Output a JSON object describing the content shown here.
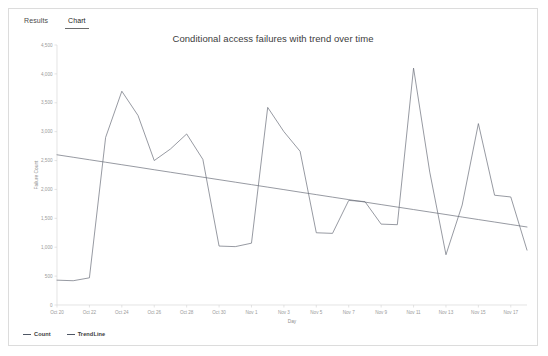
{
  "tabs": [
    {
      "label": "Results",
      "active": false
    },
    {
      "label": "Chart",
      "active": true
    }
  ],
  "chart_data": {
    "type": "line",
    "title": "Conditional access failures with trend over time",
    "xlabel": "Day",
    "ylabel": "Failure Count",
    "ylim": [
      0,
      4500
    ],
    "ytick_labels": [
      "0",
      "500",
      "1,000",
      "1,500",
      "2,000",
      "2,500",
      "3,000",
      "3,500",
      "4,000",
      "4,500"
    ],
    "ytick_values": [
      0,
      500,
      1000,
      1500,
      2000,
      2500,
      3000,
      3500,
      4000,
      4500
    ],
    "grid": false,
    "legend_position": "bottom-left",
    "categories": [
      "Oct 20",
      "Oct 21",
      "Oct 22",
      "Oct 23",
      "Oct 24",
      "Oct 25",
      "Oct 26",
      "Oct 27",
      "Oct 28",
      "Oct 29",
      "Oct 30",
      "Oct 31",
      "Nov 1",
      "Nov 2",
      "Nov 3",
      "Nov 4",
      "Nov 5",
      "Nov 6",
      "Nov 7",
      "Nov 8",
      "Nov 9",
      "Nov 10",
      "Nov 11",
      "Nov 12",
      "Nov 13",
      "Nov 14",
      "Nov 15",
      "Nov 16",
      "Nov 17",
      "Nov 18"
    ],
    "xtick_labels": [
      "Oct 20",
      "Oct 22",
      "Oct 24",
      "Oct 26",
      "Oct 28",
      "Oct 30",
      "Nov 1",
      "Nov 3",
      "Nov 5",
      "Nov 7",
      "Nov 9",
      "Nov 11",
      "Nov 13",
      "Nov 15",
      "Nov 17"
    ],
    "series": [
      {
        "name": "Count",
        "color": "#6a6f7a",
        "values": [
          430,
          420,
          470,
          2900,
          3700,
          3280,
          2500,
          2700,
          2960,
          2520,
          1020,
          1010,
          1070,
          3420,
          3000,
          2660,
          1250,
          1240,
          1810,
          1790,
          1400,
          1390,
          4100,
          2300,
          870,
          1730,
          3140,
          1900,
          1870,
          950
        ]
      },
      {
        "name": "TrendLine",
        "color": "#6a6f7a",
        "values": [
          2600,
          2557,
          2514,
          2471,
          2428,
          2385,
          2341,
          2298,
          2255,
          2212,
          2169,
          2126,
          2083,
          2040,
          1997,
          1953,
          1910,
          1867,
          1824,
          1781,
          1738,
          1695,
          1652,
          1609,
          1566,
          1522,
          1479,
          1436,
          1393,
          1350
        ]
      }
    ]
  },
  "legend": [
    {
      "label": "Count"
    },
    {
      "label": "TrendLine"
    }
  ]
}
